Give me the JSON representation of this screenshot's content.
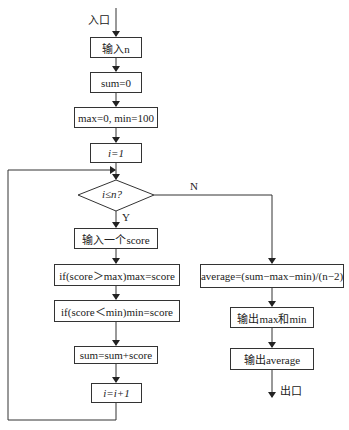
{
  "flowchart": {
    "entry_label": "入口",
    "exit_label": "出口",
    "nodes": {
      "input_n": "输入n",
      "sum_init": "sum=0",
      "max_min_init": "max=0, min=100",
      "i_init": "i=1",
      "condition": "i≤n?",
      "input_score": "输入一个score",
      "update_max": "if(score＞max)max=score",
      "update_min": "if(score＜min)min=score",
      "accumulate": "sum=sum+score",
      "increment": "i=i+1",
      "compute_average": "average=(sum−max−min)/(n−2)",
      "output_max_min": "输出max和min",
      "output_average": "输出average"
    },
    "branch_labels": {
      "yes": "Y",
      "no": "N"
    }
  }
}
